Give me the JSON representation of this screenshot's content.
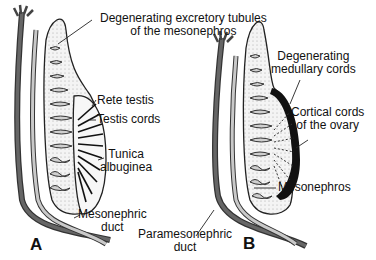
{
  "diagram": {
    "panels": [
      {
        "id": "A",
        "letter": "A",
        "depicts": "testis development"
      },
      {
        "id": "B",
        "letter": "B",
        "depicts": "ovary development"
      }
    ],
    "labels": {
      "degenerating_tubules_1": "Degenerating excretory tubules",
      "degenerating_tubules_2": "of the mesonephros",
      "rete_testis": "Rete testis",
      "testis_cords": "Testis cords",
      "tunica_1": "Tunica",
      "tunica_2": "albuginea",
      "mesonephric_duct_1": "Mesonephric",
      "mesonephric_duct_2": "duct",
      "paramesonephric_duct_1": "Paramesonephric",
      "paramesonephric_duct_2": "duct",
      "degenerating_medullary_1": "Degenerating",
      "degenerating_medullary_2": "medullary cords",
      "cortical_cords_1": "Cortical cords",
      "cortical_cords_2": "of the ovary",
      "mesonephros": "Mesonephros"
    },
    "colors": {
      "duct_dark": "#555555",
      "duct_light": "#bdbdbd",
      "outline": "#222222",
      "tissue_fill": "#f2f2f2",
      "tubule_fill": "#cfcfcf",
      "background": "#ffffff"
    }
  }
}
